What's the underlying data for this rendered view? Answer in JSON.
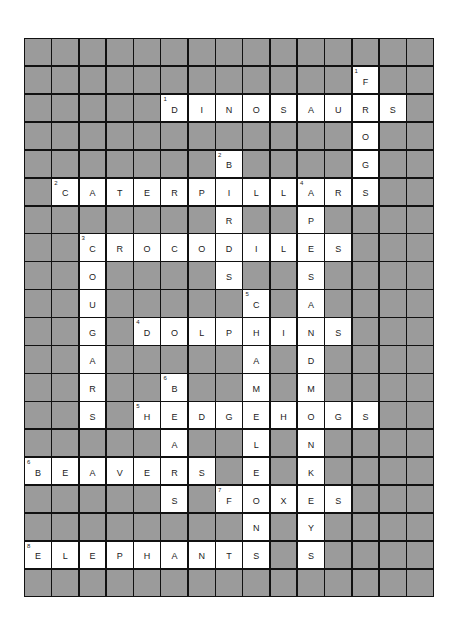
{
  "puzzle": {
    "type": "crossword",
    "cols": 15,
    "rows": 20,
    "colors": {
      "block": "#9b9b9b",
      "open": "#ffffff",
      "line": "#111111"
    },
    "grid": [
      "###############",
      "############F##",
      "#####DINOSAURS#",
      "############O##",
      "#######B####G##",
      "#CATERPILLARS##",
      "#######R##P####",
      "##CROCODILES###",
      "##O####S##S####",
      "##U#####C#A####",
      "##G#DOLPHINS###",
      "##A#####A#D####",
      "##R##B##M#M####",
      "##S#HEDGEHOGS##",
      "#####A##L#N####",
      "BEAVERS#E#K####",
      "#####S#FOXES###",
      "########N#Y####",
      "ELEPHANTS#S####",
      "###############"
    ],
    "labels": [
      {
        "row": 1,
        "col": 12,
        "num": "1"
      },
      {
        "row": 2,
        "col": 5,
        "num": "1"
      },
      {
        "row": 4,
        "col": 7,
        "num": "2"
      },
      {
        "row": 5,
        "col": 1,
        "num": "2"
      },
      {
        "row": 5,
        "col": 10,
        "num": "4"
      },
      {
        "row": 7,
        "col": 2,
        "num": "3"
      },
      {
        "row": 9,
        "col": 8,
        "num": "5"
      },
      {
        "row": 10,
        "col": 4,
        "num": "4"
      },
      {
        "row": 12,
        "col": 5,
        "num": "6"
      },
      {
        "row": 13,
        "col": 4,
        "num": "5"
      },
      {
        "row": 15,
        "col": 0,
        "num": "6"
      },
      {
        "row": 16,
        "col": 7,
        "num": "7"
      },
      {
        "row": 18,
        "col": 0,
        "num": "8"
      }
    ],
    "across": [
      {
        "num": "1",
        "answer": "DINOSAURS"
      },
      {
        "num": "2",
        "answer": "CATERPILLARS"
      },
      {
        "num": "3",
        "answer": "CROCODILES"
      },
      {
        "num": "4",
        "answer": "DOLPHINS"
      },
      {
        "num": "5",
        "answer": "HEDGEHOGS"
      },
      {
        "num": "6",
        "answer": "BEAVERS"
      },
      {
        "num": "7",
        "answer": "FOXES"
      },
      {
        "num": "8",
        "answer": "ELEPHANTS"
      }
    ],
    "down": [
      {
        "num": "1",
        "answer": "FROGS"
      },
      {
        "num": "2",
        "answer": "BIRDS"
      },
      {
        "num": "3",
        "answer": "COUGARS"
      },
      {
        "num": "4",
        "answer": "APESANDMONKEYS"
      },
      {
        "num": "5",
        "answer": "CHAMELEONS"
      },
      {
        "num": "6",
        "answer": "BEARS"
      }
    ]
  }
}
